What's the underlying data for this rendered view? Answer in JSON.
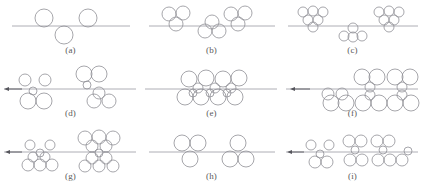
{
  "figure": {
    "title_fragment": "",
    "background_color": "#ffffff",
    "circle_stroke_color": "#8f8f96",
    "line_color": "#9a9aa2",
    "arrow_color": "#55555c",
    "label_color": "#5a5a5a",
    "columns": 3,
    "rows": 3,
    "panel_width": 141,
    "panel_height": 63
  },
  "panels": [
    {
      "id": "a",
      "label": "(a)",
      "row": 0,
      "col": 0,
      "interface_line": {
        "x1": 12,
        "x2": 130,
        "y": 26
      },
      "arrow": null,
      "circles": [
        {
          "cx": 44,
          "cy": 18,
          "r": 9
        },
        {
          "cx": 88,
          "cy": 18,
          "r": 9
        },
        {
          "cx": 64,
          "cy": 35,
          "r": 9
        }
      ]
    },
    {
      "id": "b",
      "label": "(b)",
      "row": 0,
      "col": 1,
      "interface_line": {
        "x1": 8,
        "x2": 134,
        "y": 26
      },
      "arrow": null,
      "circles": [
        {
          "cx": 28,
          "cy": 14,
          "r": 7
        },
        {
          "cx": 42,
          "cy": 13,
          "r": 7
        },
        {
          "cx": 35,
          "cy": 24,
          "r": 7
        },
        {
          "cx": 90,
          "cy": 14,
          "r": 7
        },
        {
          "cx": 104,
          "cy": 13,
          "r": 7
        },
        {
          "cx": 97,
          "cy": 24,
          "r": 7
        },
        {
          "cx": 64,
          "cy": 31,
          "r": 7
        },
        {
          "cx": 78,
          "cy": 31,
          "r": 7
        },
        {
          "cx": 71,
          "cy": 22,
          "r": 7
        }
      ]
    },
    {
      "id": "c",
      "label": "(c)",
      "row": 0,
      "col": 2,
      "interface_line": {
        "x1": 6,
        "x2": 136,
        "y": 26
      },
      "arrow": null,
      "circles": [
        {
          "cx": 21,
          "cy": 12,
          "r": 5
        },
        {
          "cx": 31,
          "cy": 11,
          "r": 5
        },
        {
          "cx": 41,
          "cy": 12,
          "r": 5
        },
        {
          "cx": 26,
          "cy": 20,
          "r": 5
        },
        {
          "cx": 36,
          "cy": 20,
          "r": 5
        },
        {
          "cx": 31,
          "cy": 27,
          "r": 5
        },
        {
          "cx": 97,
          "cy": 12,
          "r": 5
        },
        {
          "cx": 107,
          "cy": 11,
          "r": 5
        },
        {
          "cx": 117,
          "cy": 12,
          "r": 5
        },
        {
          "cx": 102,
          "cy": 20,
          "r": 5
        },
        {
          "cx": 112,
          "cy": 20,
          "r": 5
        },
        {
          "cx": 107,
          "cy": 27,
          "r": 5
        },
        {
          "cx": 71,
          "cy": 28,
          "r": 5
        },
        {
          "cx": 62,
          "cy": 36,
          "r": 5
        },
        {
          "cx": 71,
          "cy": 37,
          "r": 5
        },
        {
          "cx": 80,
          "cy": 36,
          "r": 5
        }
      ]
    },
    {
      "id": "d",
      "label": "(d)",
      "row": 1,
      "col": 0,
      "interface_line": {
        "x1": 4,
        "x2": 136,
        "y": 26
      },
      "arrow": {
        "x_tail": 22,
        "x_head": 4,
        "y": 26
      },
      "circles": [
        {
          "cx": 25,
          "cy": 17,
          "r": 6
        },
        {
          "cx": 45,
          "cy": 17,
          "r": 6
        },
        {
          "cx": 33,
          "cy": 28,
          "r": 4
        },
        {
          "cx": 28,
          "cy": 38,
          "r": 8
        },
        {
          "cx": 44,
          "cy": 38,
          "r": 8
        },
        {
          "cx": 84,
          "cy": 11,
          "r": 8
        },
        {
          "cx": 99,
          "cy": 11,
          "r": 8
        },
        {
          "cx": 87,
          "cy": 22,
          "r": 4
        },
        {
          "cx": 99,
          "cy": 30,
          "r": 6
        },
        {
          "cx": 94,
          "cy": 38,
          "r": 7
        },
        {
          "cx": 109,
          "cy": 38,
          "r": 7
        }
      ]
    },
    {
      "id": "e",
      "label": "(e)",
      "row": 1,
      "col": 1,
      "interface_line": {
        "x1": 4,
        "x2": 136,
        "y": 26
      },
      "arrow": null,
      "circles": [
        {
          "cx": 48,
          "cy": 16,
          "r": 8
        },
        {
          "cx": 65,
          "cy": 15,
          "r": 8
        },
        {
          "cx": 82,
          "cy": 16,
          "r": 8
        },
        {
          "cx": 98,
          "cy": 15,
          "r": 8
        },
        {
          "cx": 57,
          "cy": 25,
          "r": 5
        },
        {
          "cx": 74,
          "cy": 25,
          "r": 5
        },
        {
          "cx": 90,
          "cy": 25,
          "r": 5
        },
        {
          "cx": 44,
          "cy": 34,
          "r": 8
        },
        {
          "cx": 60,
          "cy": 34,
          "r": 8
        },
        {
          "cx": 77,
          "cy": 34,
          "r": 8
        },
        {
          "cx": 94,
          "cy": 34,
          "r": 8
        },
        {
          "cx": 52,
          "cy": 30,
          "r": 4
        },
        {
          "cx": 69,
          "cy": 30,
          "r": 4
        },
        {
          "cx": 86,
          "cy": 30,
          "r": 4
        }
      ]
    },
    {
      "id": "f",
      "label": "(f)",
      "row": 1,
      "col": 2,
      "interface_line": {
        "x1": 4,
        "x2": 136,
        "y": 26
      },
      "arrow": {
        "x_tail": 28,
        "x_head": 8,
        "y": 26
      },
      "circles": [
        {
          "cx": 46,
          "cy": 31,
          "r": 6
        },
        {
          "cx": 60,
          "cy": 31,
          "r": 6
        },
        {
          "cx": 49,
          "cy": 40,
          "r": 8
        },
        {
          "cx": 64,
          "cy": 40,
          "r": 8
        },
        {
          "cx": 80,
          "cy": 14,
          "r": 8
        },
        {
          "cx": 95,
          "cy": 14,
          "r": 8
        },
        {
          "cx": 113,
          "cy": 14,
          "r": 8
        },
        {
          "cx": 128,
          "cy": 14,
          "r": 8
        },
        {
          "cx": 88,
          "cy": 24,
          "r": 5
        },
        {
          "cx": 120,
          "cy": 24,
          "r": 5
        },
        {
          "cx": 88,
          "cy": 32,
          "r": 5
        },
        {
          "cx": 120,
          "cy": 32,
          "r": 5
        },
        {
          "cx": 81,
          "cy": 40,
          "r": 8
        },
        {
          "cx": 97,
          "cy": 40,
          "r": 8
        },
        {
          "cx": 113,
          "cy": 40,
          "r": 8
        },
        {
          "cx": 129,
          "cy": 40,
          "r": 8
        }
      ]
    },
    {
      "id": "g",
      "label": "(g)",
      "row": 2,
      "col": 0,
      "interface_line": {
        "x1": 4,
        "x2": 136,
        "y": 26
      },
      "arrow": {
        "x_tail": 22,
        "x_head": 5,
        "y": 26
      },
      "circles": [
        {
          "cx": 30,
          "cy": 19,
          "r": 5
        },
        {
          "cx": 50,
          "cy": 19,
          "r": 5
        },
        {
          "cx": 40,
          "cy": 27,
          "r": 4
        },
        {
          "cx": 33,
          "cy": 31,
          "r": 5
        },
        {
          "cx": 45,
          "cy": 31,
          "r": 5
        },
        {
          "cx": 28,
          "cy": 39,
          "r": 6
        },
        {
          "cx": 40,
          "cy": 39,
          "r": 6
        },
        {
          "cx": 52,
          "cy": 39,
          "r": 6
        },
        {
          "cx": 85,
          "cy": 12,
          "r": 7
        },
        {
          "cx": 99,
          "cy": 11,
          "r": 7
        },
        {
          "cx": 113,
          "cy": 12,
          "r": 7
        },
        {
          "cx": 92,
          "cy": 20,
          "r": 6
        },
        {
          "cx": 106,
          "cy": 20,
          "r": 6
        },
        {
          "cx": 99,
          "cy": 27,
          "r": 4
        },
        {
          "cx": 92,
          "cy": 32,
          "r": 6
        },
        {
          "cx": 106,
          "cy": 32,
          "r": 6
        },
        {
          "cx": 85,
          "cy": 40,
          "r": 6
        },
        {
          "cx": 99,
          "cy": 40,
          "r": 6
        },
        {
          "cx": 113,
          "cy": 40,
          "r": 6
        }
      ]
    },
    {
      "id": "h",
      "label": "(h)",
      "row": 2,
      "col": 1,
      "interface_line": {
        "x1": 8,
        "x2": 134,
        "y": 26
      },
      "arrow": null,
      "circles": [
        {
          "cx": 41,
          "cy": 17,
          "r": 8
        },
        {
          "cx": 57,
          "cy": 17,
          "r": 8
        },
        {
          "cx": 49,
          "cy": 33,
          "r": 8
        },
        {
          "cx": 97,
          "cy": 17,
          "r": 8
        },
        {
          "cx": 89,
          "cy": 33,
          "r": 8
        },
        {
          "cx": 105,
          "cy": 33,
          "r": 8
        }
      ]
    },
    {
      "id": "i",
      "label": "(i)",
      "row": 2,
      "col": 2,
      "interface_line": {
        "x1": 4,
        "x2": 136,
        "y": 26
      },
      "arrow": {
        "x_tail": 22,
        "x_head": 5,
        "y": 26
      },
      "circles": [
        {
          "cx": 29,
          "cy": 19,
          "r": 5
        },
        {
          "cx": 47,
          "cy": 19,
          "r": 5
        },
        {
          "cx": 38,
          "cy": 28,
          "r": 4
        },
        {
          "cx": 33,
          "cy": 36,
          "r": 6
        },
        {
          "cx": 45,
          "cy": 36,
          "r": 6
        },
        {
          "cx": 67,
          "cy": 15,
          "r": 6
        },
        {
          "cx": 79,
          "cy": 15,
          "r": 6
        },
        {
          "cx": 73,
          "cy": 24,
          "r": 4
        },
        {
          "cx": 68,
          "cy": 34,
          "r": 6
        },
        {
          "cx": 80,
          "cy": 34,
          "r": 6
        },
        {
          "cx": 95,
          "cy": 15,
          "r": 6
        },
        {
          "cx": 107,
          "cy": 15,
          "r": 6
        },
        {
          "cx": 101,
          "cy": 24,
          "r": 4
        },
        {
          "cx": 96,
          "cy": 34,
          "r": 6
        },
        {
          "cx": 108,
          "cy": 34,
          "r": 6
        },
        {
          "cx": 120,
          "cy": 34,
          "r": 6
        },
        {
          "cx": 126,
          "cy": 25,
          "r": 4
        }
      ]
    }
  ]
}
